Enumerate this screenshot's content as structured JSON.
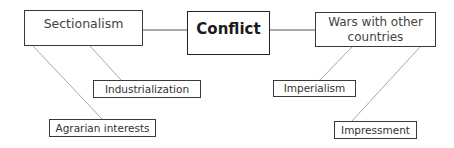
{
  "diagram": {
    "type": "concept-map",
    "center": {
      "label": "Conflict"
    },
    "branches": [
      {
        "label": "Sectionalism",
        "children": [
          {
            "label": "Industrialization"
          },
          {
            "label": "Agrarian interests"
          }
        ]
      },
      {
        "label": "Wars with other countries",
        "label_lines": [
          "Wars with other",
          "countries"
        ],
        "children": [
          {
            "label": "Imperialism"
          },
          {
            "label": "Impressment"
          }
        ]
      }
    ]
  },
  "colors": {
    "box_border": "#3a3a3a",
    "center_border": "#222222",
    "trunk_line": "#555555",
    "branch_line": "#a8a8a8",
    "background": "#ffffff"
  }
}
